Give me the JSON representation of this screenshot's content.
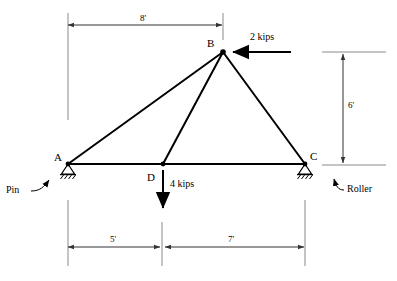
{
  "diagram": {
    "stroke_color": "#000000",
    "dimension_color": "#555555",
    "joints": [
      {
        "id": "A",
        "label": "A",
        "x": 68,
        "y": 164,
        "support": "pin"
      },
      {
        "id": "B",
        "label": "B",
        "x": 223,
        "y": 52,
        "support": "none"
      },
      {
        "id": "C",
        "label": "C",
        "x": 305,
        "y": 164,
        "support": "roller"
      },
      {
        "id": "D",
        "label": "D",
        "x": 163,
        "y": 164,
        "support": "none"
      }
    ],
    "members": [
      {
        "from": "A",
        "to": "B"
      },
      {
        "from": "B",
        "to": "D"
      },
      {
        "from": "B",
        "to": "C"
      },
      {
        "from": "A",
        "to": "C"
      }
    ],
    "loads": [
      {
        "id": "load-at-b",
        "label": "2 kips",
        "magnitude": 2,
        "unit": "kips",
        "direction": "left",
        "applied_at": "B"
      },
      {
        "id": "load-at-d",
        "label": "4 kips",
        "magnitude": 4,
        "unit": "kips",
        "direction": "down",
        "applied_at": "D"
      }
    ],
    "dimensions": [
      {
        "id": "dim-top-span",
        "label": "8'",
        "value": 8,
        "unit": "ft",
        "orientation": "horizontal",
        "from": "A",
        "to": "B"
      },
      {
        "id": "dim-height",
        "label": "6'",
        "value": 6,
        "unit": "ft",
        "orientation": "vertical",
        "from": "C",
        "to": "B"
      },
      {
        "id": "dim-bottom-left",
        "label": "5'",
        "value": 5,
        "unit": "ft",
        "orientation": "horizontal",
        "from": "A",
        "to": "D"
      },
      {
        "id": "dim-bottom-right",
        "label": "7'",
        "value": 7,
        "unit": "ft",
        "orientation": "horizontal",
        "from": "D",
        "to": "C"
      }
    ],
    "supports": [
      {
        "id": "support-pin",
        "label": "Pin",
        "at": "A"
      },
      {
        "id": "support-roller",
        "label": "Roller",
        "at": "C"
      }
    ]
  }
}
